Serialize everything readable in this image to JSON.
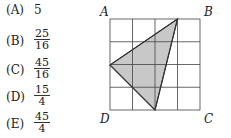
{
  "choices": [
    {
      "letter": "(A)",
      "value": "5",
      "type": "int"
    },
    {
      "letter": "(B)",
      "num": "25",
      "den": "16",
      "type": "frac"
    },
    {
      "letter": "(C)",
      "num": "45",
      "den": "16",
      "type": "frac"
    },
    {
      "letter": "(D)",
      "num": "15",
      "den": "4",
      "type": "frac"
    },
    {
      "letter": "(E)",
      "num": "45",
      "den": "4",
      "type": "frac"
    }
  ],
  "figure": {
    "labels": {
      "A": "A",
      "B": "B",
      "C": "C",
      "D": "D"
    },
    "grid_size": 4,
    "shade_color": "#c8c8c8",
    "triangle_grid_points": [
      [
        3,
        0
      ],
      [
        0,
        2
      ],
      [
        2,
        4
      ]
    ]
  }
}
